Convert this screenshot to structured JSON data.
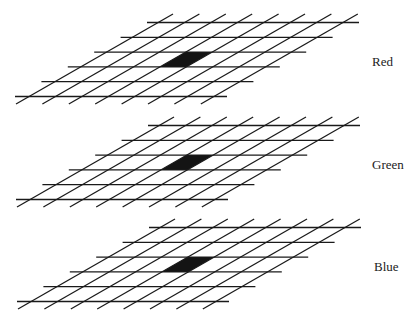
{
  "figure": {
    "grid": {
      "diagonal_count": 8,
      "horizontal_count": 6,
      "highlight_cell": {
        "row_from_bottom": 2,
        "column": 3
      },
      "line_color": "#1a1a1a",
      "fill_color": "#141414"
    },
    "layers": [
      {
        "label": "Red",
        "y_offset": 0,
        "x_offset": 0
      },
      {
        "label": "Green",
        "y_offset": 103,
        "x_offset": 1
      },
      {
        "label": "Blue",
        "y_offset": 205,
        "x_offset": 2
      }
    ]
  }
}
